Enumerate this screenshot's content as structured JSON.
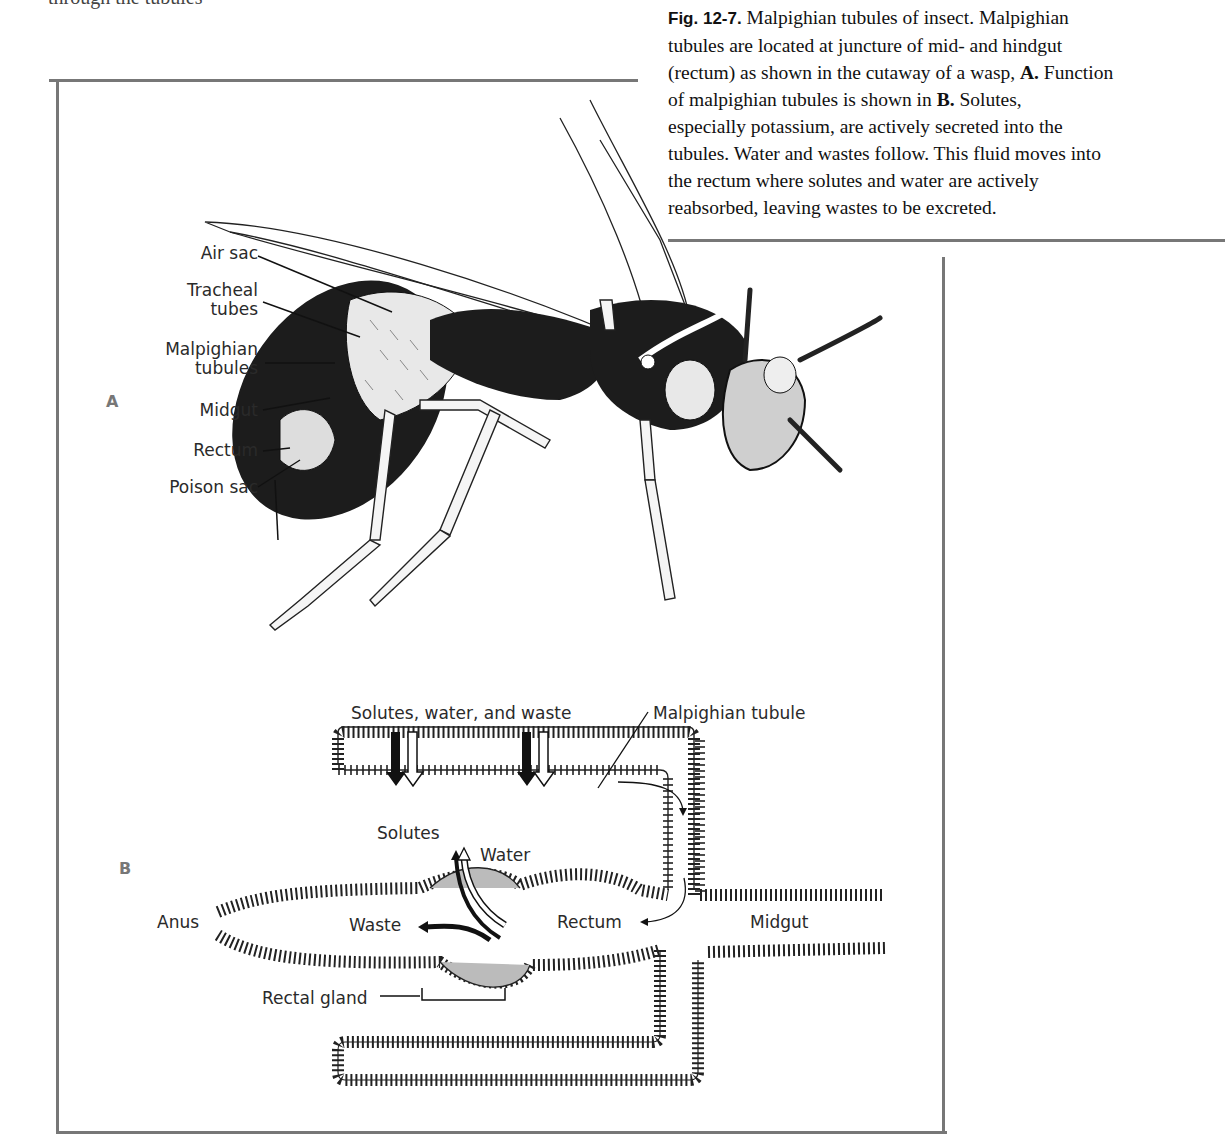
{
  "page": {
    "top_fragment": "through the tubules"
  },
  "caption": {
    "fig_label": "Fig. 12-7.",
    "lines": [
      " Malpighian tubules of insect. Malpighian",
      "tubules are located at juncture of mid- and hindgut",
      "(rectum) as shown in the cutaway of a wasp, ",
      "A.",
      " Function",
      "of malpighian tubules is shown in ",
      "B.",
      " Solutes,",
      "especially potassium, are actively secreted into the",
      "tubules. Water and wastes follow. This fluid moves into",
      "the rectum where solutes and water are actively",
      "reabsorbed, leaving wastes to be excreted."
    ]
  },
  "panel_a": {
    "letter": "A",
    "labels": {
      "air_sac": "Air sac",
      "tracheal_1": "Tracheal",
      "tracheal_2": "tubes",
      "malpighian_1": "Malpighian",
      "malpighian_2": "tubules",
      "midgut": "Midgut",
      "rectum": "Rectum",
      "poison_sac": "Poison sac"
    }
  },
  "panel_b": {
    "letter": "B",
    "labels": {
      "inflow": "Solutes, water, and waste",
      "tubule": "Malpighian tubule",
      "solutes": "Solutes",
      "water": "Water",
      "waste": "Waste",
      "anus": "Anus",
      "rectum": "Rectum",
      "midgut": "Midgut",
      "rectal_gland": "Rectal gland"
    }
  }
}
